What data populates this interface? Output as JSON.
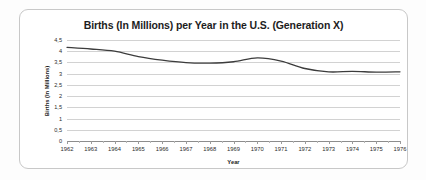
{
  "chart_data": {
    "type": "line",
    "title": "Births (In Millions) per Year in the U.S. (Generation X)",
    "xlabel": "Year",
    "ylabel": "Births (In Millions)",
    "categories": [
      1962,
      1963,
      1964,
      1965,
      1966,
      1967,
      1968,
      1969,
      1970,
      1971,
      1972,
      1973,
      1974,
      1975,
      1976
    ],
    "x": [
      1962,
      1963,
      1964,
      1965,
      1966,
      1967,
      1968,
      1969,
      1970,
      1971,
      1972,
      1973,
      1974,
      1975,
      1976
    ],
    "values": [
      4.17,
      4.1,
      4.0,
      3.76,
      3.6,
      3.49,
      3.47,
      3.53,
      3.7,
      3.56,
      3.23,
      3.08,
      3.1,
      3.07,
      3.08
    ],
    "series": [
      {
        "name": "Births (In Millions)",
        "values": [
          4.17,
          4.1,
          4.0,
          3.76,
          3.6,
          3.49,
          3.47,
          3.53,
          3.7,
          3.56,
          3.23,
          3.08,
          3.1,
          3.07,
          3.08
        ],
        "color": "#3c3c3c"
      }
    ],
    "xlim": [
      1962,
      1976
    ],
    "ylim": [
      0,
      4.5
    ],
    "y_ticks": [
      0,
      0.5,
      1,
      1.5,
      2,
      2.5,
      3,
      3.5,
      4,
      4.5
    ],
    "y_tick_labels": [
      "0",
      "0,5",
      "1",
      "1,5",
      "2",
      "2,5",
      "3",
      "3,5",
      "4",
      "4,5"
    ],
    "x_tick_labels": [
      "1962",
      "1963",
      "1964",
      "1965",
      "1966",
      "1967",
      "1968",
      "1969",
      "1970",
      "1971",
      "1972",
      "1973",
      "1974",
      "1975",
      "1976"
    ],
    "grid": "horizontal",
    "grid_color": "#d2d2d2",
    "legend": "none",
    "markers": false,
    "smoothed": true,
    "background": "#ffffff",
    "border_color": "#c8c8c8"
  }
}
